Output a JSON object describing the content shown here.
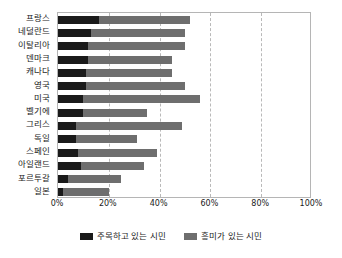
{
  "chart_data": {
    "type": "bar",
    "orientation": "horizontal",
    "stacked": true,
    "title": "",
    "xlabel": "",
    "ylabel": "",
    "xlim": [
      0,
      100
    ],
    "xticks": [
      0,
      20,
      40,
      60,
      80,
      100
    ],
    "xtick_labels": [
      "0%",
      "20%",
      "40%",
      "60%",
      "80%",
      "100%"
    ],
    "grid": true,
    "grid_axis": "x",
    "grid_style": "dashed",
    "legend_position": "bottom",
    "categories": [
      "프랑스",
      "네덜란드",
      "이탈리아",
      "덴마크",
      "캐나다",
      "영국",
      "미국",
      "벨기에",
      "그리스",
      "독일",
      "스페인",
      "아일랜드",
      "포르투갈",
      "일본"
    ],
    "series": [
      {
        "name": "주목하고 있는 시민",
        "color": "#1a1a1a",
        "values": [
          16,
          13,
          12,
          12,
          11,
          11,
          10,
          10,
          7,
          7,
          8,
          9,
          4,
          2
        ]
      },
      {
        "name": "흥미가 있는 시민",
        "color": "#6e6e6e",
        "values": [
          36,
          37,
          38,
          33,
          34,
          39,
          46,
          25,
          42,
          24,
          31,
          25,
          21,
          18
        ]
      }
    ],
    "totals": [
      52,
      50,
      50,
      45,
      45,
      50,
      56,
      35,
      49,
      31,
      39,
      34,
      25,
      20
    ]
  },
  "legend": {
    "items": [
      {
        "label": "주목하고 있는 시민",
        "color": "#1a1a1a"
      },
      {
        "label": "흥미가 있는 시민",
        "color": "#6e6e6e"
      }
    ]
  }
}
